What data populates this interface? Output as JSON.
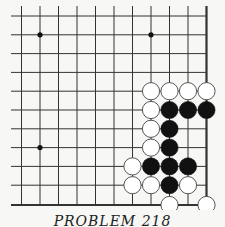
{
  "diagram": {
    "type": "go-problem",
    "caption": "PROBLEM 218",
    "colors": {
      "background": "#f7f7f5",
      "line": "#333333",
      "black_stone": "#111111",
      "white_stone": "#ffffff",
      "stone_outline": "#444444"
    },
    "grid": {
      "columns": 11,
      "rows": 11,
      "col_x": [
        21.5,
        40,
        58.5,
        77,
        95.5,
        114,
        132.5,
        151,
        169.5,
        188,
        206.5
      ],
      "row_y": [
        16,
        34.8,
        53.6,
        72.4,
        91.2,
        110,
        128.8,
        147.6,
        166.4,
        185.2,
        205
      ],
      "right_edge": true,
      "bottom_edge": true,
      "line_start_x": 11,
      "line_start_y": 6
    },
    "star_points": [
      {
        "col": 1,
        "row": 1
      },
      {
        "col": 7,
        "row": 1
      },
      {
        "col": 1,
        "row": 7
      }
    ],
    "stones": [
      {
        "color": "white",
        "col": 7,
        "row": 4
      },
      {
        "color": "white",
        "col": 8,
        "row": 4
      },
      {
        "color": "white",
        "col": 9,
        "row": 4
      },
      {
        "color": "white",
        "col": 10,
        "row": 4
      },
      {
        "color": "white",
        "col": 7,
        "row": 5
      },
      {
        "color": "black",
        "col": 8,
        "row": 5
      },
      {
        "color": "black",
        "col": 9,
        "row": 5
      },
      {
        "color": "black",
        "col": 10,
        "row": 5
      },
      {
        "color": "white",
        "col": 7,
        "row": 6
      },
      {
        "color": "black",
        "col": 8,
        "row": 6
      },
      {
        "color": "white",
        "col": 7,
        "row": 7
      },
      {
        "color": "black",
        "col": 8,
        "row": 7
      },
      {
        "color": "white",
        "col": 6,
        "row": 8
      },
      {
        "color": "black",
        "col": 7,
        "row": 8
      },
      {
        "color": "black",
        "col": 8,
        "row": 8
      },
      {
        "color": "black",
        "col": 9,
        "row": 8
      },
      {
        "color": "white",
        "col": 6,
        "row": 9
      },
      {
        "color": "white",
        "col": 7,
        "row": 9
      },
      {
        "color": "black",
        "col": 8,
        "row": 9
      },
      {
        "color": "white",
        "col": 9,
        "row": 9
      },
      {
        "color": "white",
        "col": 8,
        "row": 10
      },
      {
        "color": "white",
        "col": 10,
        "row": 10
      }
    ]
  }
}
